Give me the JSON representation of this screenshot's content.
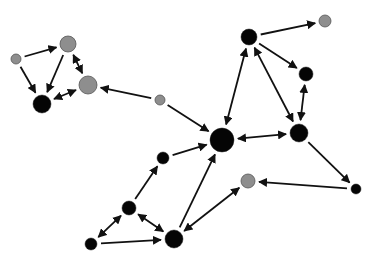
{
  "diagram": {
    "type": "directed-network-graph",
    "colors": {
      "black_node": "#050505",
      "gray_node": "#8e8e8e",
      "edge": "#111111",
      "background": "#ffffff"
    },
    "nodes": [
      {
        "id": "A",
        "x": 16,
        "y": 59,
        "r": 5,
        "color": "gray"
      },
      {
        "id": "B",
        "x": 68,
        "y": 44,
        "r": 8,
        "color": "gray"
      },
      {
        "id": "C",
        "x": 88,
        "y": 85,
        "r": 9,
        "color": "gray"
      },
      {
        "id": "D",
        "x": 42,
        "y": 104,
        "r": 9,
        "color": "black"
      },
      {
        "id": "E",
        "x": 160,
        "y": 100,
        "r": 5,
        "color": "gray"
      },
      {
        "id": "F",
        "x": 222,
        "y": 140,
        "r": 12,
        "color": "black"
      },
      {
        "id": "G",
        "x": 249,
        "y": 37,
        "r": 8,
        "color": "black"
      },
      {
        "id": "H",
        "x": 325,
        "y": 21,
        "r": 6,
        "color": "gray"
      },
      {
        "id": "I",
        "x": 306,
        "y": 74,
        "r": 7,
        "color": "black"
      },
      {
        "id": "J",
        "x": 299,
        "y": 133,
        "r": 9,
        "color": "black"
      },
      {
        "id": "K",
        "x": 163,
        "y": 158,
        "r": 6,
        "color": "black"
      },
      {
        "id": "L",
        "x": 129,
        "y": 208,
        "r": 7,
        "color": "black"
      },
      {
        "id": "M",
        "x": 174,
        "y": 239,
        "r": 9,
        "color": "black"
      },
      {
        "id": "N",
        "x": 91,
        "y": 244,
        "r": 6,
        "color": "black"
      },
      {
        "id": "O",
        "x": 248,
        "y": 181,
        "r": 7,
        "color": "gray"
      },
      {
        "id": "P",
        "x": 356,
        "y": 189,
        "r": 5,
        "color": "black"
      }
    ],
    "edges": [
      {
        "from": "A",
        "to": "B",
        "bidirectional": false
      },
      {
        "from": "A",
        "to": "D",
        "bidirectional": false
      },
      {
        "from": "B",
        "to": "D",
        "bidirectional": false
      },
      {
        "from": "B",
        "to": "C",
        "bidirectional": true
      },
      {
        "from": "C",
        "to": "D",
        "bidirectional": true
      },
      {
        "from": "E",
        "to": "C",
        "bidirectional": false
      },
      {
        "from": "E",
        "to": "F",
        "bidirectional": false
      },
      {
        "from": "G",
        "to": "H",
        "bidirectional": false
      },
      {
        "from": "G",
        "to": "F",
        "bidirectional": true
      },
      {
        "from": "G",
        "to": "J",
        "bidirectional": true
      },
      {
        "from": "G",
        "to": "I",
        "bidirectional": false
      },
      {
        "from": "I",
        "to": "J",
        "bidirectional": true
      },
      {
        "from": "J",
        "to": "F",
        "bidirectional": true
      },
      {
        "from": "J",
        "to": "P",
        "bidirectional": false
      },
      {
        "from": "P",
        "to": "O",
        "bidirectional": false
      },
      {
        "from": "K",
        "to": "F",
        "bidirectional": false
      },
      {
        "from": "L",
        "to": "K",
        "bidirectional": false
      },
      {
        "from": "L",
        "to": "N",
        "bidirectional": true
      },
      {
        "from": "L",
        "to": "M",
        "bidirectional": true
      },
      {
        "from": "N",
        "to": "M",
        "bidirectional": false
      },
      {
        "from": "M",
        "to": "F",
        "bidirectional": false
      },
      {
        "from": "M",
        "to": "O",
        "bidirectional": true
      }
    ]
  }
}
